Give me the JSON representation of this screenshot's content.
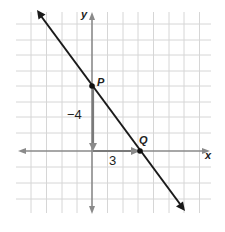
{
  "diagram": {
    "type": "coordinate-plane-line",
    "axes": {
      "x_label": "x",
      "y_label": "y"
    },
    "points": [
      {
        "name": "P",
        "coords": [
          0,
          4
        ]
      },
      {
        "name": "Q",
        "coords": [
          3,
          0
        ]
      }
    ],
    "rise_label": "−4",
    "run_label": "3",
    "colors": {
      "grid": "#d4d4d4",
      "axis": "#8a8a8a",
      "line": "#1a1a1a",
      "slope_arrow": "#8a8a8a"
    }
  }
}
